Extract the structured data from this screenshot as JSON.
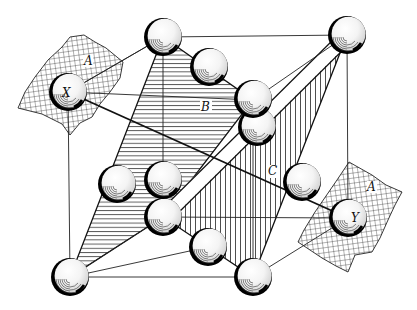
{
  "figure": {
    "labels": {
      "plane_a_left": "A",
      "plane_a_right": "A",
      "plane_b": "B",
      "plane_c": "C",
      "atom_x": "X",
      "atom_y": "Y"
    },
    "planes": [
      {
        "id": "A",
        "pattern": "cross-hatch",
        "count": 2
      },
      {
        "id": "B",
        "pattern": "horizontal-hatch"
      },
      {
        "id": "C",
        "pattern": "vertical-hatch"
      }
    ],
    "atoms": [
      {
        "name": "top-back-left",
        "cx": 163,
        "cy": 37
      },
      {
        "name": "top-back-right",
        "cx": 347,
        "cy": 35
      },
      {
        "name": "top-face-center",
        "cx": 209,
        "cy": 67
      },
      {
        "name": "edge-upper-a",
        "cx": 253,
        "cy": 99
      },
      {
        "name": "edge-upper-b",
        "cx": 257,
        "cy": 127
      },
      {
        "name": "atom-x",
        "cx": 68,
        "cy": 92
      },
      {
        "name": "left-face-center",
        "cx": 117,
        "cy": 184
      },
      {
        "name": "center-upper",
        "cx": 163,
        "cy": 180
      },
      {
        "name": "center-lower",
        "cx": 163,
        "cy": 217
      },
      {
        "name": "right-face-center",
        "cx": 302,
        "cy": 182
      },
      {
        "name": "bottom-face-center",
        "cx": 208,
        "cy": 247
      },
      {
        "name": "bottom-front-left",
        "cx": 70,
        "cy": 277
      },
      {
        "name": "bottom-front-right",
        "cx": 253,
        "cy": 277
      },
      {
        "name": "atom-y",
        "cx": 348,
        "cy": 218
      }
    ]
  }
}
